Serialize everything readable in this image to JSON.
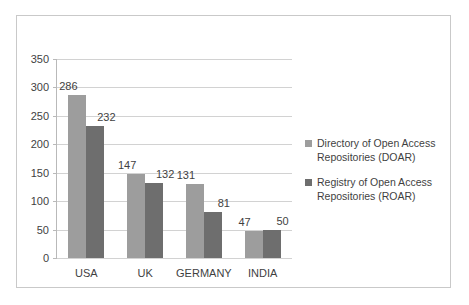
{
  "chart_data": {
    "type": "bar",
    "title": "",
    "subtitle": "",
    "xlabel": "",
    "ylabel": "",
    "categories": [
      "USA",
      "UK",
      "GERMANY",
      "INDIA"
    ],
    "series": [
      {
        "name": "Directory of Open Access Repositories (DOAR)",
        "color": "#9d9d9d",
        "values": [
          286,
          147,
          131,
          47
        ]
      },
      {
        "name": "Registry of Open Access Repositories (ROAR)",
        "color": "#6e6e6e",
        "values": [
          232,
          132,
          81,
          50
        ]
      }
    ],
    "ylim": [
      0,
      350
    ],
    "ytick_labels": [
      "0",
      "50",
      "100",
      "150",
      "200",
      "250",
      "300",
      "350"
    ],
    "ytick_values": [
      0,
      50,
      100,
      150,
      200,
      250,
      300,
      350
    ],
    "grid": true,
    "legend_position": "right",
    "data_labels": true,
    "border_color": "#c9c9c9",
    "gridline_color": "#d2d2d2",
    "text_color": "#3f3f3f",
    "background": "#ffffff"
  },
  "legend": {
    "entries": [
      {
        "line1": "Directory of Open Access",
        "line2": "Repositories (DOAR)"
      },
      {
        "line1": "Registry of Open Access",
        "line2": "Repositories (ROAR)"
      }
    ]
  }
}
